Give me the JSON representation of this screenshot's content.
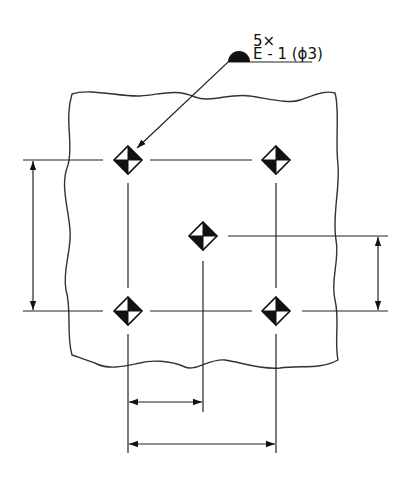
{
  "diagram": {
    "type": "technical drawing - datum target points on plate",
    "callout": {
      "multiplier": "5×",
      "designation": "E - 1 (ϕ3)",
      "symbol": "datum-target-half-disc"
    },
    "datum_targets": [
      {
        "id": "top-left",
        "x": 128,
        "y": 160
      },
      {
        "id": "top-right",
        "x": 276,
        "y": 160
      },
      {
        "id": "center",
        "x": 203,
        "y": 236
      },
      {
        "id": "bottom-left",
        "x": 128,
        "y": 311
      },
      {
        "id": "bottom-right",
        "x": 276,
        "y": 311
      }
    ],
    "dimensions": [
      {
        "id": "left-vertical",
        "orientation": "vertical",
        "from": "top row",
        "to": "bottom row"
      },
      {
        "id": "right-vertical",
        "orientation": "vertical",
        "from": "center row",
        "to": "bottom row"
      },
      {
        "id": "bottom-short",
        "orientation": "horizontal",
        "from": "left column",
        "to": "center column"
      },
      {
        "id": "bottom-long",
        "orientation": "horizontal",
        "from": "left column",
        "to": "right column"
      }
    ],
    "colors": {
      "ink": "#222222",
      "background": "#ffffff"
    }
  }
}
